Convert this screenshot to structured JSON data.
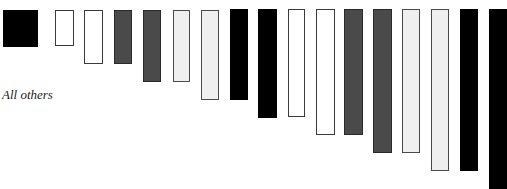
{
  "legend": {
    "label": "All others",
    "swatch_color": "#000000"
  },
  "colors": {
    "black": "#000000",
    "white": "#ffffff",
    "dark": "#4a4a4a",
    "light": "#efefef"
  },
  "bars": [
    {
      "x": 55,
      "y": 10,
      "w": 19,
      "h": 36,
      "fill": "white"
    },
    {
      "x": 84,
      "y": 10,
      "w": 19,
      "h": 54,
      "fill": "white"
    },
    {
      "x": 114,
      "y": 10,
      "w": 18,
      "h": 54,
      "fill": "dark"
    },
    {
      "x": 143,
      "y": 10,
      "w": 18,
      "h": 72,
      "fill": "dark"
    },
    {
      "x": 173,
      "y": 10,
      "w": 17,
      "h": 72,
      "fill": "light"
    },
    {
      "x": 201,
      "y": 10,
      "w": 18,
      "h": 90,
      "fill": "light"
    },
    {
      "x": 230,
      "y": 9,
      "w": 18,
      "h": 91,
      "fill": "black"
    },
    {
      "x": 258,
      "y": 9,
      "w": 19,
      "h": 109,
      "fill": "black"
    },
    {
      "x": 288,
      "y": 9,
      "w": 17,
      "h": 108,
      "fill": "white"
    },
    {
      "x": 316,
      "y": 9,
      "w": 19,
      "h": 126,
      "fill": "white"
    },
    {
      "x": 344,
      "y": 9,
      "w": 19,
      "h": 126,
      "fill": "dark"
    },
    {
      "x": 373,
      "y": 9,
      "w": 19,
      "h": 144,
      "fill": "dark"
    },
    {
      "x": 402,
      "y": 9,
      "w": 18,
      "h": 144,
      "fill": "light"
    },
    {
      "x": 431,
      "y": 9,
      "w": 18,
      "h": 162,
      "fill": "light"
    },
    {
      "x": 460,
      "y": 9,
      "w": 18,
      "h": 162,
      "fill": "black"
    },
    {
      "x": 489,
      "y": 9,
      "w": 18,
      "h": 180,
      "fill": "black"
    }
  ]
}
